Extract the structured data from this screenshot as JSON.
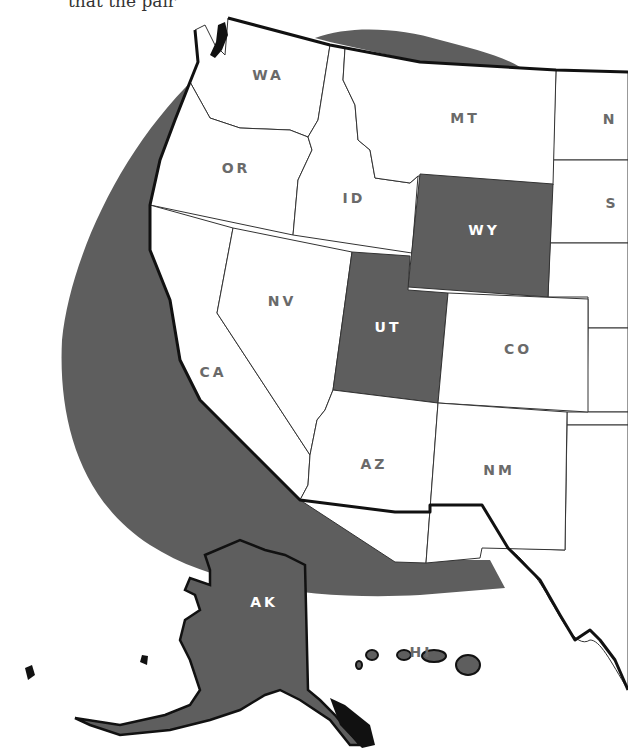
{
  "caption": "that the pair",
  "colors": {
    "region_band": "#5e5e5e",
    "highlighted_state": "#5e5e5e",
    "state_fill": "#ffffff",
    "label_gray": "#6a6a6a",
    "label_on_dark": "#ffffff"
  },
  "map": {
    "title": "Western United States",
    "states": [
      {
        "abbr": "WA",
        "highlighted": false
      },
      {
        "abbr": "OR",
        "highlighted": false
      },
      {
        "abbr": "CA",
        "highlighted": false
      },
      {
        "abbr": "ID",
        "highlighted": false
      },
      {
        "abbr": "NV",
        "highlighted": false
      },
      {
        "abbr": "MT",
        "highlighted": false
      },
      {
        "abbr": "WY",
        "highlighted": true
      },
      {
        "abbr": "UT",
        "highlighted": true
      },
      {
        "abbr": "CO",
        "highlighted": false
      },
      {
        "abbr": "AZ",
        "highlighted": false
      },
      {
        "abbr": "NM",
        "highlighted": false
      },
      {
        "abbr": "AK",
        "highlighted": true
      },
      {
        "abbr": "HI",
        "highlighted": false
      },
      {
        "abbr": "N",
        "highlighted": false,
        "partial": true
      },
      {
        "abbr": "S",
        "highlighted": false,
        "partial": true
      }
    ],
    "labels": {
      "wa": "WA",
      "or": "OR",
      "ca": "CA",
      "id": "ID",
      "nv": "NV",
      "mt": "MT",
      "wy": "WY",
      "ut": "UT",
      "co": "CO",
      "az": "AZ",
      "nm": "NM",
      "ak": "AK",
      "hi": "HI",
      "nd_partial": "N",
      "sd_partial": "S"
    }
  }
}
